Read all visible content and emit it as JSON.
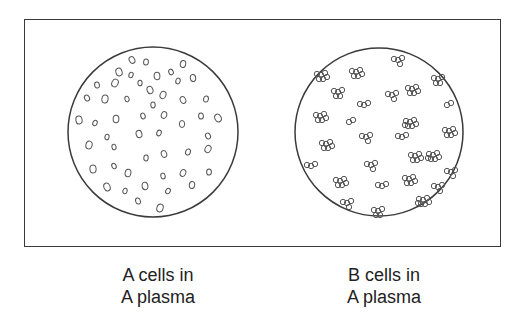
{
  "figure": {
    "panels": [
      {
        "id": "left",
        "caption_line1": "A cells in",
        "caption_line2": "A plasma",
        "cell_state": "dispersed (no agglutination)"
      },
      {
        "id": "right",
        "caption_line1": "B cells in",
        "caption_line2": "A plasma",
        "cell_state": "clumped (agglutinated)"
      }
    ],
    "colors": {
      "stroke": "#3a3a3a",
      "background": "#ffffff",
      "text": "#222222"
    }
  }
}
